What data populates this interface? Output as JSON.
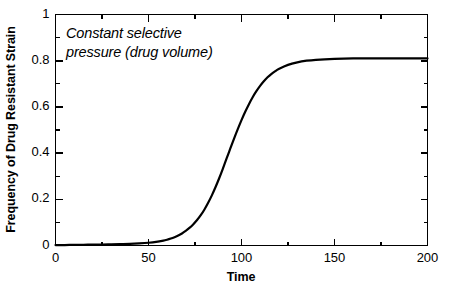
{
  "chart_data": {
    "type": "line",
    "title": "",
    "subtitle": "",
    "xlabel": "Time",
    "ylabel": "Frequency of Drug Resistant Strain",
    "xlim": [
      0,
      200
    ],
    "ylim": [
      0,
      1
    ],
    "xticks": [
      "0",
      "50",
      "100",
      "150",
      "200"
    ],
    "xtick_values": [
      0,
      50,
      100,
      150,
      200
    ],
    "xminor_step": 25,
    "yticks": [
      "0",
      "0.2",
      "0.4",
      "0.6",
      "0.8",
      "1"
    ],
    "ytick_values": [
      0,
      0.2,
      0.4,
      0.6,
      0.8,
      1
    ],
    "yminor_step": 0.1,
    "grid": false,
    "legend": "none",
    "line_color": "#000000",
    "line_width": 2.2,
    "frame_color": "#000000",
    "background": "#ffffff",
    "annotations": [
      {
        "text": "Constant selective\npressure (drug volume)",
        "style": "italic",
        "x": 10,
        "y": 0.93
      }
    ],
    "series": [
      {
        "name": "Frequency of drug resistant strain",
        "asymptote": 0.81,
        "midpoint": 88,
        "x": [
          0,
          5,
          10,
          15,
          20,
          25,
          30,
          35,
          40,
          45,
          50,
          55,
          58,
          60,
          62,
          64,
          66,
          68,
          70,
          72,
          74,
          76,
          78,
          80,
          82,
          84,
          86,
          88,
          90,
          92,
          94,
          96,
          98,
          100,
          102,
          104,
          106,
          108,
          110,
          112,
          114,
          116,
          118,
          120,
          125,
          130,
          135,
          140,
          150,
          160,
          170,
          180,
          190,
          200
        ],
        "y": [
          0.002,
          0.002,
          0.003,
          0.003,
          0.004,
          0.004,
          0.005,
          0.006,
          0.007,
          0.009,
          0.012,
          0.017,
          0.021,
          0.025,
          0.03,
          0.036,
          0.043,
          0.052,
          0.063,
          0.076,
          0.091,
          0.109,
          0.13,
          0.155,
          0.184,
          0.216,
          0.252,
          0.291,
          0.333,
          0.377,
          0.42,
          0.463,
          0.504,
          0.543,
          0.579,
          0.612,
          0.642,
          0.668,
          0.691,
          0.711,
          0.728,
          0.742,
          0.754,
          0.764,
          0.782,
          0.793,
          0.8,
          0.804,
          0.808,
          0.81,
          0.81,
          0.81,
          0.81,
          0.81
        ]
      }
    ]
  }
}
